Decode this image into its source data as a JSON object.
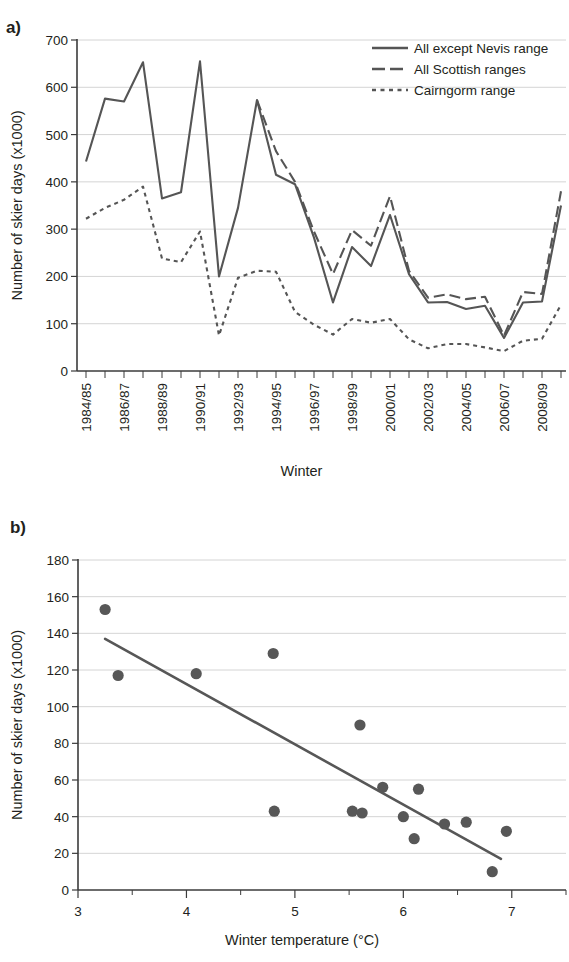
{
  "figure": {
    "panel_a_label": "a)",
    "panel_b_label": "b)"
  },
  "chart_data": [
    {
      "id": "panel_a",
      "type": "line",
      "title": "",
      "xlabel": "Winter",
      "ylabel": "Number of skier days (x1000)",
      "ylim": [
        0,
        700
      ],
      "yticks": [
        0,
        100,
        200,
        300,
        400,
        500,
        600,
        700
      ],
      "ytick_labels": [
        "0",
        "100",
        "200",
        "300",
        "400",
        "500",
        "600",
        "700"
      ],
      "grid": true,
      "legend_position": "top-right",
      "categories": [
        "1984/85",
        "1985/86",
        "1986/87",
        "1987/88",
        "1988/89",
        "1989/90",
        "1990/91",
        "1991/92",
        "1992/93",
        "1993/94",
        "1994/95",
        "1995/96",
        "1996/97",
        "1997/98",
        "1998/99",
        "1999/00",
        "2000/01",
        "2001/02",
        "2002/03",
        "2003/04",
        "2004/05",
        "2005/06",
        "2006/07",
        "2007/08",
        "2008/09",
        "2009/10"
      ],
      "xtick_labels_shown": [
        "1984/85",
        "1986/87",
        "1988/89",
        "1990/91",
        "1992/93",
        "1994/95",
        "1996/97",
        "1998/99",
        "2000/01",
        "2002/03",
        "2004/05",
        "2006/07",
        "2008/09"
      ],
      "series": [
        {
          "name": "All except Nevis range",
          "style": "solid",
          "values": [
            443,
            576,
            570,
            653,
            365,
            378,
            655,
            200,
            345,
            573,
            415,
            395,
            282,
            145,
            262,
            222,
            330,
            205,
            145,
            146,
            131,
            138,
            70,
            145,
            147,
            350
          ]
        },
        {
          "name": "All Scottish ranges",
          "style": "dashed",
          "values": [
            null,
            null,
            null,
            null,
            null,
            null,
            null,
            null,
            null,
            573,
            465,
            400,
            295,
            205,
            298,
            265,
            370,
            212,
            155,
            162,
            152,
            157,
            75,
            167,
            163,
            380
          ]
        },
        {
          "name": "Cairngorm range",
          "style": "dotted",
          "values": [
            322,
            345,
            362,
            390,
            238,
            230,
            295,
            75,
            197,
            212,
            210,
            125,
            98,
            77,
            110,
            102,
            110,
            67,
            48,
            57,
            57,
            50,
            42,
            64,
            68,
            140
          ]
        }
      ]
    },
    {
      "id": "panel_b",
      "type": "scatter",
      "title": "",
      "xlabel": "Winter temperature (°C)",
      "ylabel": "Number of skier days (x1000)",
      "xlim": [
        3,
        7.5
      ],
      "ylim": [
        0,
        180
      ],
      "xticks": [
        3,
        4,
        5,
        6,
        7
      ],
      "xtick_labels": [
        "3",
        "4",
        "5",
        "6",
        "7"
      ],
      "yticks": [
        0,
        20,
        40,
        60,
        80,
        100,
        120,
        140,
        160,
        180
      ],
      "ytick_labels": [
        "0",
        "20",
        "40",
        "60",
        "80",
        "100",
        "120",
        "140",
        "160",
        "180"
      ],
      "grid": true,
      "points": [
        {
          "x": 3.25,
          "y": 153
        },
        {
          "x": 3.37,
          "y": 117
        },
        {
          "x": 4.09,
          "y": 118
        },
        {
          "x": 4.8,
          "y": 129
        },
        {
          "x": 4.81,
          "y": 43
        },
        {
          "x": 5.53,
          "y": 43
        },
        {
          "x": 5.6,
          "y": 90
        },
        {
          "x": 5.62,
          "y": 42
        },
        {
          "x": 5.81,
          "y": 56
        },
        {
          "x": 6.0,
          "y": 40
        },
        {
          "x": 6.1,
          "y": 28
        },
        {
          "x": 6.14,
          "y": 55
        },
        {
          "x": 6.38,
          "y": 36
        },
        {
          "x": 6.58,
          "y": 37
        },
        {
          "x": 6.82,
          "y": 10
        },
        {
          "x": 6.95,
          "y": 32
        }
      ],
      "trend_line": {
        "x0": 3.25,
        "y0": 137,
        "x1": 6.9,
        "y1": 17
      }
    }
  ],
  "colors": {
    "series": "#555555",
    "dots": "#575757",
    "grid": "#c9c9c9",
    "axis": "#3b3b3b",
    "text": "#231f20",
    "background": "#ffffff"
  }
}
